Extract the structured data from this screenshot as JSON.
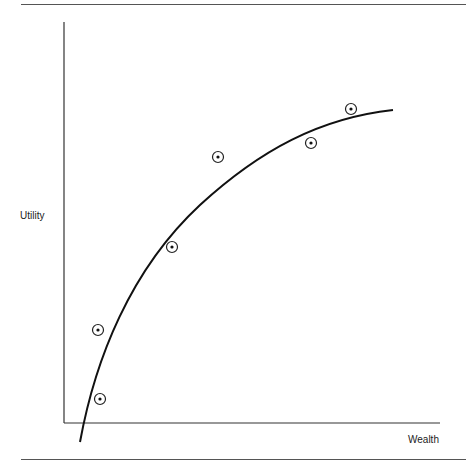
{
  "chart_data": {
    "type": "scatter",
    "title": "",
    "xlabel": "Wealth",
    "ylabel": "Utility",
    "grid": false,
    "legend": null,
    "points": [
      {
        "x": 100,
        "y": 399
      },
      {
        "x": 98,
        "y": 330
      },
      {
        "x": 172,
        "y": 247
      },
      {
        "x": 218,
        "y": 157
      },
      {
        "x": 311,
        "y": 143
      },
      {
        "x": 351,
        "y": 109
      }
    ],
    "curve": {
      "shape": "concave-increasing",
      "start": {
        "x": 80,
        "y": 442
      },
      "end": {
        "x": 393,
        "y": 110
      }
    }
  },
  "axes": {
    "x_label": "Wealth",
    "y_label": "Utility"
  }
}
